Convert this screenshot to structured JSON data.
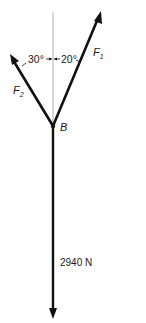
{
  "diagram": {
    "type": "free-body force diagram",
    "point": {
      "label": "B"
    },
    "forces": [
      {
        "name": "F1",
        "label_main": "F",
        "label_sub": "1",
        "angle_from_vertical_deg": 20,
        "side": "right"
      },
      {
        "name": "F2",
        "label_main": "F",
        "label_sub": "2",
        "angle_from_vertical_deg": 30,
        "side": "left"
      },
      {
        "name": "weight",
        "label": "2940 N",
        "direction": "down"
      }
    ],
    "angles": [
      {
        "label": "30°"
      },
      {
        "label": "20°"
      }
    ]
  }
}
